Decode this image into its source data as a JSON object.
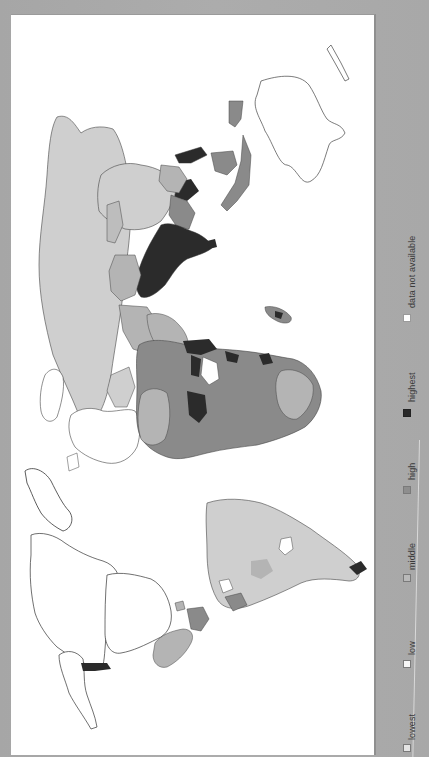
{
  "figure": {
    "type": "choropleth-world-map",
    "orientation": "rotated 90 degrees clockwise (north points left)",
    "background_color": "#a9a9a9",
    "map_background": "#ffffff"
  },
  "legend": {
    "items": [
      {
        "label": "lowest",
        "color": "#e4e4e4"
      },
      {
        "label": "low",
        "color": "#f6f6f6"
      },
      {
        "label": "middle",
        "color": "#b9b9b9"
      },
      {
        "label": "high",
        "color": "#8e8e8e"
      },
      {
        "label": "highest",
        "color": "#2a2a2a"
      },
      {
        "label": "data not available",
        "color": "#ffffff"
      }
    ]
  },
  "map": {
    "colors": {
      "outline": "#3b3b3b",
      "lowest": "#cfcfcf",
      "low": "#ffffff",
      "middle": "#b4b4b4",
      "high": "#8a8a8a",
      "highest": "#2b2b2b",
      "na": "#ffffff"
    }
  }
}
